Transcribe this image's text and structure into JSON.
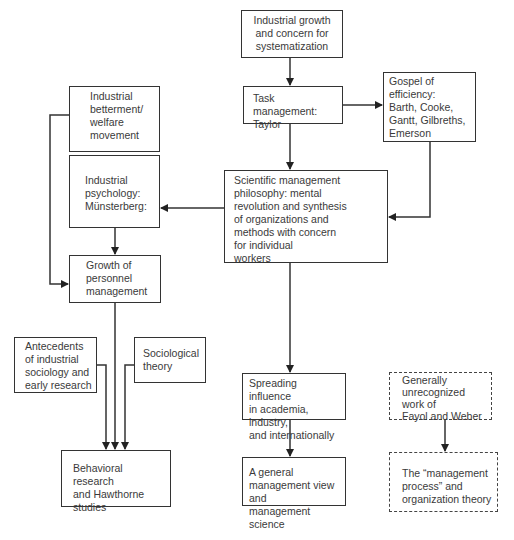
{
  "diagram": {
    "nodes": [
      {
        "id": "industrial-growth",
        "label": "Industrial growth\nand concern for\nsystematization",
        "style": "solid"
      },
      {
        "id": "task-management",
        "label": "Task management:\nTaylor",
        "style": "solid"
      },
      {
        "id": "gospel-of-efficiency",
        "label": "Gospel of\nefficiency:\nBarth, Cooke,\nGantt, Gilbreths,\nEmerson",
        "style": "solid"
      },
      {
        "id": "industrial-betterment",
        "label": "Industrial\nbetterment/\nwelfare\nmovement",
        "style": "solid"
      },
      {
        "id": "industrial-psychology",
        "label": "Industrial\npsychology:\nMünsterberg:",
        "style": "solid"
      },
      {
        "id": "scientific-management",
        "label": "Scientific management\nphilosophy: mental\nrevolution and synthesis\nof organizations and\nmethods with concern\nfor individual\nworkers",
        "style": "solid"
      },
      {
        "id": "growth-of-personnel",
        "label": "Growth of\npersonnel\nmanagement",
        "style": "solid"
      },
      {
        "id": "antecedents",
        "label": "Antecedents\nof industrial\nsociology and\nearly research",
        "style": "solid"
      },
      {
        "id": "sociological-theory",
        "label": "Sociological\ntheory",
        "style": "solid"
      },
      {
        "id": "behavioral-research",
        "label": "Behavioral research\nand Hawthorne\nstudies",
        "style": "solid"
      },
      {
        "id": "spreading-influence",
        "label": "Spreading influence\nin academia, industry,\nand internationally",
        "style": "solid"
      },
      {
        "id": "general-management",
        "label": "A general\nmanagement view and\nmanagement science",
        "style": "solid"
      },
      {
        "id": "fayol-weber",
        "label": "Generally\nunrecognized\nwork of\nFayol and Weber",
        "style": "dashed"
      },
      {
        "id": "management-process",
        "label": "The “management\nprocess” and\norganization theory",
        "style": "dashed"
      }
    ],
    "edges": [
      {
        "from": "industrial-growth",
        "to": "task-management"
      },
      {
        "from": "task-management",
        "to": "gospel-of-efficiency"
      },
      {
        "from": "task-management",
        "to": "scientific-management"
      },
      {
        "from": "gospel-of-efficiency",
        "to": "scientific-management"
      },
      {
        "from": "scientific-management",
        "to": "industrial-psychology"
      },
      {
        "from": "industrial-betterment",
        "to": "growth-of-personnel"
      },
      {
        "from": "industrial-psychology",
        "to": "growth-of-personnel"
      },
      {
        "from": "growth-of-personnel",
        "to": "behavioral-research"
      },
      {
        "from": "antecedents",
        "to": "behavioral-research"
      },
      {
        "from": "sociological-theory",
        "to": "behavioral-research"
      },
      {
        "from": "scientific-management",
        "to": "spreading-influence"
      },
      {
        "from": "spreading-influence",
        "to": "general-management"
      },
      {
        "from": "fayol-weber",
        "to": "management-process"
      }
    ],
    "colors": {
      "line": "#333333",
      "text": "#3a3a3a",
      "background": "#ffffff"
    }
  }
}
